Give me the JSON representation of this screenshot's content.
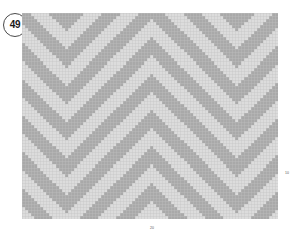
{
  "badge": {
    "number": "49",
    "shape": "circle"
  },
  "axes": {
    "x_tick_label": "20",
    "y_tick_label": "10"
  },
  "colors": {
    "light": "#dcdcdc",
    "dark": "#a9a9a9",
    "grid_line": "#c2c2c2",
    "badge_border": "#4a4a4a",
    "badge_text": "#1a1a1a",
    "tick_text": "#5a5a5a",
    "background": "#ffffff"
  },
  "chart_data": {
    "type": "heatmap",
    "title": "",
    "subtitle": "",
    "xlabel": "",
    "ylabel": "",
    "grid": true,
    "legend": "none",
    "cols": 84,
    "rows": 68,
    "cell_px": 3.048,
    "xlim": [
      0,
      84
    ],
    "ylim": [
      0,
      68
    ],
    "xticks": [
      20
    ],
    "yticks": [
      10
    ],
    "xtick_labels": [
      "20"
    ],
    "ytick_labels": [
      "10"
    ],
    "value_levels": [
      0,
      1
    ],
    "level_colors": [
      "#dcdcdc",
      "#a9a9a9"
    ],
    "pattern": {
      "kind": "chevron",
      "band_period": 12,
      "dark_band_width": 6,
      "apex_columns": [
        14,
        42,
        70
      ],
      "slope": 1,
      "notes": "Diagonal bands of width 6 cells repeat every 12 cells; direction mirrors about each apex column producing downward-pointing V shapes."
    }
  }
}
